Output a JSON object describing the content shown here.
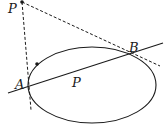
{
  "diagram": {
    "type": "geometry",
    "colors": {
      "stroke": "#1a1a1a",
      "background": "#ffffff"
    },
    "labels": {
      "external_point": "P",
      "point_a": "A",
      "point_b": "B",
      "interior_point": "P"
    },
    "elements": {
      "ellipse": {
        "cx": 92,
        "cy": 85,
        "rx": 64,
        "ry": 38
      },
      "chord_line": {
        "x1": 8,
        "y1": 93,
        "x2": 163,
        "y2": 43
      },
      "tangent_at_a": {
        "x1": 22,
        "y1": 2,
        "x2": 31,
        "y2": 110,
        "style": "dashed"
      },
      "tangent_at_b": {
        "x1": 22,
        "y1": 2,
        "x2": 160,
        "y2": 66,
        "style": "dashed"
      },
      "external_point_dot": {
        "x": 22,
        "y": 2
      },
      "ellipse_dot": {
        "x": 37,
        "y": 64
      }
    }
  }
}
